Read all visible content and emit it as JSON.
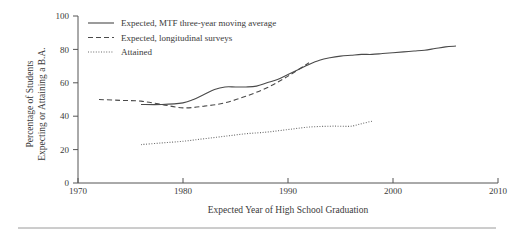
{
  "chart_data": {
    "type": "line",
    "title": "",
    "xlabel": "Expected Year of High School Graduation",
    "ylabel": "Percentage of Students Expecting or Attaining a B.A.",
    "xlim": [
      1970,
      2010
    ],
    "ylim": [
      0,
      100
    ],
    "xticks": [
      1970,
      1980,
      1990,
      2000,
      2010
    ],
    "xticklabels": [
      "1970",
      "1980",
      "1990",
      "2000",
      "2010"
    ],
    "yticks": [
      0,
      20,
      40,
      60,
      80,
      100
    ],
    "yticklabels": [
      "0",
      "20",
      "40",
      "60",
      "80",
      "100"
    ],
    "grid": false,
    "legend_position": "top-left-inside",
    "series": [
      {
        "name": "Expected, MTF three-year moving average",
        "style": "solid",
        "color": "#4a4a4a",
        "x": [
          1976,
          1978,
          1980,
          1981,
          1982,
          1983,
          1984,
          1985,
          1986,
          1987,
          1988,
          1989,
          1990,
          1991,
          1992,
          1993,
          1994,
          1995,
          1996,
          1997,
          1998,
          1999,
          2000,
          2001,
          2002,
          2003,
          2004,
          2005,
          2006
        ],
        "values": [
          47,
          47,
          48,
          50,
          53,
          56,
          57.5,
          57.5,
          57.5,
          58,
          60,
          62,
          65,
          68,
          71,
          73.5,
          75,
          76,
          76.5,
          77,
          77,
          77.5,
          78,
          78.5,
          79,
          79.5,
          80.5,
          81.5,
          82
        ]
      },
      {
        "name": "Expected, longitudinal surveys",
        "style": "dashed",
        "color": "#4a4a4a",
        "x": [
          1972,
          1974,
          1976,
          1978,
          1980,
          1982,
          1984,
          1986,
          1988,
          1990,
          1992
        ],
        "values": [
          50,
          49.5,
          49,
          47,
          45,
          46,
          48,
          52,
          57,
          64,
          72
        ]
      },
      {
        "name": "Attained",
        "style": "dotted",
        "color": "#6a6a6a",
        "x": [
          1976,
          1978,
          1980,
          1982,
          1984,
          1986,
          1988,
          1990,
          1992,
          1994,
          1995,
          1996,
          1997,
          1998
        ],
        "values": [
          23,
          24,
          25,
          26.5,
          28,
          29.5,
          30.5,
          32,
          33.5,
          34,
          34,
          34,
          35.5,
          37
        ]
      }
    ]
  },
  "legend": {
    "items": [
      {
        "label": "Expected, MTF three-year moving average",
        "style": "solid"
      },
      {
        "label": "Expected, longitudinal surveys",
        "style": "dashed"
      },
      {
        "label": "Attained",
        "style": "dotted"
      }
    ]
  },
  "axes": {
    "y_label_line1": "Percentage of Students",
    "y_label_line2": "Expecting or Attaining a B.A.",
    "x_label": "Expected Year of High School Graduation"
  }
}
